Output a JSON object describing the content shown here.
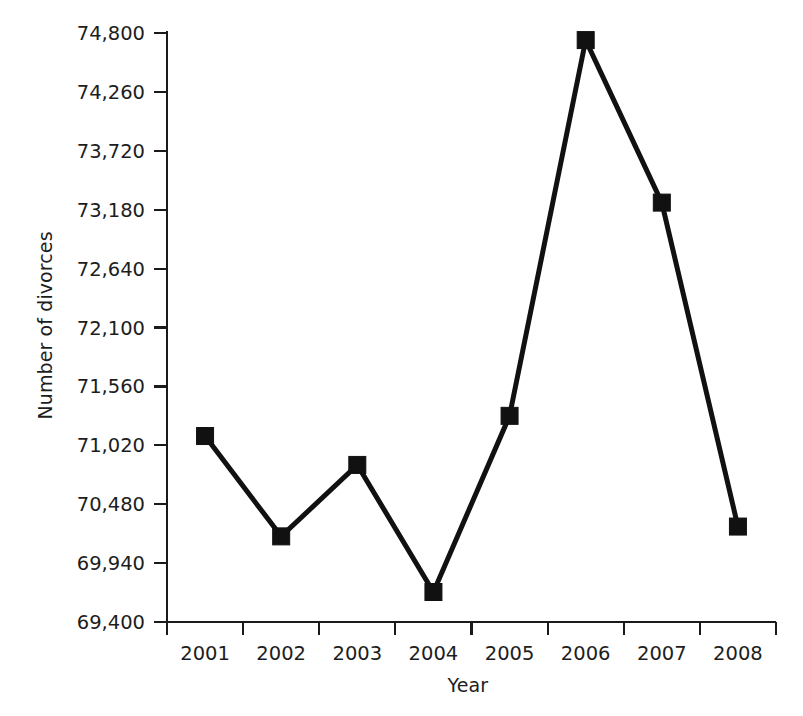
{
  "chart_data": {
    "type": "line",
    "title": "",
    "xlabel": "Year",
    "ylabel": "Number of divorces",
    "categories": [
      "2001",
      "2002",
      "2003",
      "2004",
      "2005",
      "2006",
      "2007",
      "2008"
    ],
    "values": [
      71105,
      70185,
      70840,
      69675,
      71290,
      74735,
      73245,
      70275
    ],
    "series": [
      {
        "name": "Number of divorces",
        "values": [
          71105,
          70185,
          70840,
          69675,
          71290,
          74735,
          73245,
          70275
        ]
      }
    ],
    "ylim": [
      69400,
      74800
    ],
    "ytick_labels": [
      "74,800",
      "74,260",
      "73,720",
      "73,180",
      "72,640",
      "72,100",
      "71,560",
      "71,020",
      "70,480",
      "69,940",
      "69,400"
    ],
    "ytick_values": [
      74800,
      74260,
      73720,
      73180,
      72640,
      72100,
      71560,
      71020,
      70480,
      69940,
      69400
    ],
    "ytick_step": 540,
    "xtick_labels": [
      "2001",
      "2002",
      "2003",
      "2004",
      "2005",
      "2006",
      "2007",
      "2008"
    ],
    "grid": false,
    "legend": false,
    "legend_position": "none",
    "marker": "square",
    "line_color": "#111111",
    "marker_color": "#111111",
    "axis_color": "#1a1a1a",
    "background_color": "#ffffff"
  },
  "axes": {
    "y_title": "Number of divorces",
    "x_title": "Year"
  }
}
